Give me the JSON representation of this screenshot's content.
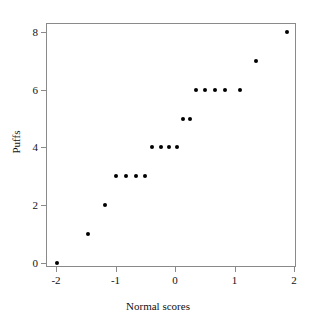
{
  "chart_data": {
    "type": "scatter",
    "title": "",
    "xlabel": "Normal scores",
    "ylabel": "Puffs",
    "xlim": [
      -2.2,
      2.2
    ],
    "ylim": [
      -0.45,
      8.45
    ],
    "xticks": [
      -2,
      -1,
      0,
      1,
      2
    ],
    "xticklabels": [
      "-2",
      "-1",
      "0",
      "1",
      "2"
    ],
    "yticks": [
      0,
      2,
      4,
      6,
      8
    ],
    "yticklabels": [
      "0",
      "2",
      "4",
      "6",
      "8"
    ],
    "grid": false,
    "legend": false,
    "marker": "filled-circle",
    "marker_color": "#000000",
    "frame_color": "#8a8a8a",
    "points": [
      {
        "x": -1.98,
        "y": 0
      },
      {
        "x": -1.46,
        "y": 1
      },
      {
        "x": -1.18,
        "y": 2
      },
      {
        "x": -0.99,
        "y": 3
      },
      {
        "x": -0.82,
        "y": 3
      },
      {
        "x": -0.66,
        "y": 3
      },
      {
        "x": -0.5,
        "y": 3
      },
      {
        "x": -0.39,
        "y": 4
      },
      {
        "x": -0.24,
        "y": 4
      },
      {
        "x": -0.1,
        "y": 4
      },
      {
        "x": 0.03,
        "y": 4
      },
      {
        "x": 0.13,
        "y": 5
      },
      {
        "x": 0.25,
        "y": 5
      },
      {
        "x": 0.35,
        "y": 6
      },
      {
        "x": 0.5,
        "y": 6
      },
      {
        "x": 0.67,
        "y": 6
      },
      {
        "x": 0.84,
        "y": 6
      },
      {
        "x": 1.09,
        "y": 6
      },
      {
        "x": 1.36,
        "y": 7
      },
      {
        "x": 1.88,
        "y": 8
      }
    ]
  }
}
